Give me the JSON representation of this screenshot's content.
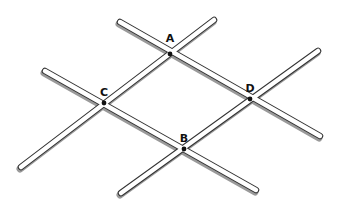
{
  "diagram": {
    "type": "intersecting-rods",
    "colors": {
      "rod_fill": "#ffffff",
      "rod_outline": "#333333",
      "rod_shadow": "#9a9a9a",
      "point": "#111111",
      "label": "#111111"
    },
    "rods": [
      {
        "id": "rod-AD",
        "x1": 120,
        "y1": 22,
        "x2": 320,
        "y2": 136
      },
      {
        "id": "rod-CB",
        "x1": 45,
        "y1": 71,
        "x2": 256,
        "y2": 190
      },
      {
        "id": "rod-CA",
        "x1": 21,
        "y1": 167,
        "x2": 214,
        "y2": 20
      },
      {
        "id": "rod-BD",
        "x1": 121,
        "y1": 193,
        "x2": 318,
        "y2": 51
      }
    ],
    "points": [
      {
        "name": "A",
        "x": 170,
        "y": 54,
        "lx": 168,
        "ly": 40
      },
      {
        "name": "C",
        "x": 104,
        "y": 103,
        "lx": 102,
        "ly": 94
      },
      {
        "name": "D",
        "x": 250,
        "y": 99,
        "lx": 248,
        "ly": 90
      },
      {
        "name": "B",
        "x": 184,
        "y": 149,
        "lx": 182,
        "ly": 140
      }
    ]
  }
}
